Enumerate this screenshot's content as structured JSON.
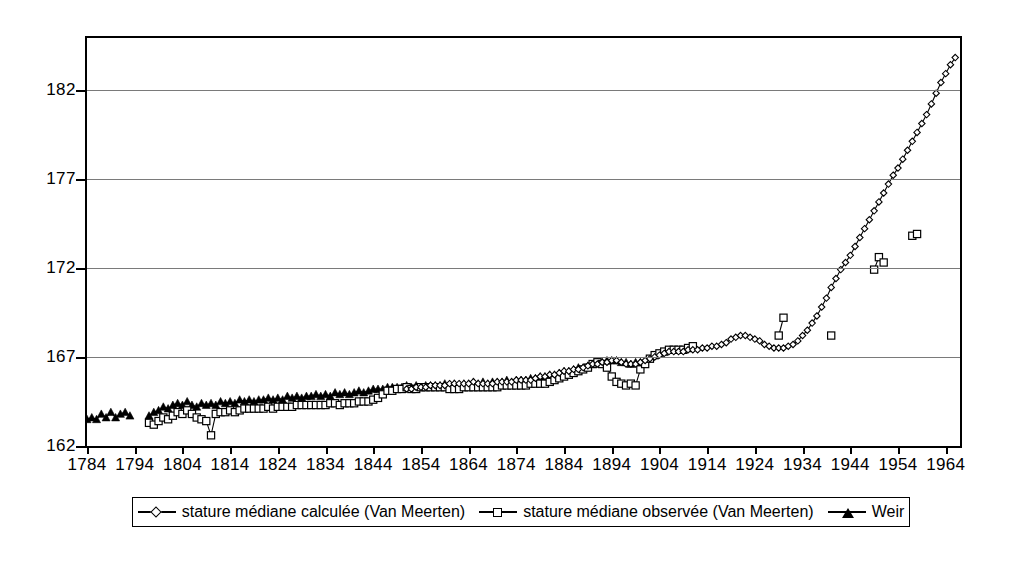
{
  "chart_data": {
    "type": "line",
    "title": "",
    "xlabel": "",
    "ylabel": "",
    "xlim": [
      1784,
      1967
    ],
    "ylim": [
      162,
      184.9
    ],
    "grid": true,
    "y_ticks": [
      162,
      167,
      172,
      177,
      182
    ],
    "x_ticks": [
      1784,
      1794,
      1804,
      1814,
      1824,
      1834,
      1844,
      1854,
      1864,
      1874,
      1884,
      1894,
      1904,
      1914,
      1924,
      1934,
      1944,
      1954,
      1964
    ],
    "legend_position": "bottom",
    "series": [
      {
        "name": "stature médiane calculée (Van Meerten)",
        "marker": "diamond",
        "line": true,
        "color": "#000000",
        "x": [
          1851,
          1852,
          1853,
          1854,
          1855,
          1856,
          1857,
          1858,
          1859,
          1860,
          1861,
          1862,
          1863,
          1864,
          1865,
          1866,
          1867,
          1868,
          1869,
          1870,
          1871,
          1872,
          1873,
          1874,
          1875,
          1876,
          1877,
          1878,
          1879,
          1880,
          1881,
          1882,
          1883,
          1884,
          1885,
          1886,
          1887,
          1888,
          1889,
          1890,
          1891,
          1892,
          1893,
          1894,
          1895,
          1896,
          1897,
          1898,
          1899,
          1900,
          1901,
          1902,
          1903,
          1904,
          1905,
          1906,
          1907,
          1908,
          1909,
          1910,
          1911,
          1912,
          1913,
          1914,
          1915,
          1916,
          1917,
          1918,
          1919,
          1920,
          1921,
          1922,
          1923,
          1924,
          1925,
          1926,
          1927,
          1928,
          1929,
          1930,
          1931,
          1932,
          1933,
          1934,
          1935,
          1936,
          1937,
          1938,
          1939,
          1940,
          1941,
          1942,
          1943,
          1944,
          1945,
          1946,
          1947,
          1948,
          1949,
          1950,
          1951,
          1952,
          1953,
          1954,
          1955,
          1956,
          1957,
          1958,
          1959,
          1960,
          1961,
          1962,
          1963,
          1964,
          1965,
          1966
        ],
        "y": [
          165.2,
          165.2,
          165.3,
          165.3,
          165.3,
          165.4,
          165.4,
          165.4,
          165.4,
          165.5,
          165.5,
          165.5,
          165.5,
          165.5,
          165.6,
          165.5,
          165.5,
          165.5,
          165.5,
          165.6,
          165.6,
          165.6,
          165.6,
          165.7,
          165.7,
          165.7,
          165.7,
          165.8,
          165.9,
          165.9,
          166.0,
          166.0,
          166.1,
          166.2,
          166.2,
          166.3,
          166.3,
          166.4,
          166.5,
          166.6,
          166.6,
          166.7,
          166.7,
          166.8,
          166.8,
          166.7,
          166.6,
          166.6,
          166.6,
          166.7,
          166.8,
          166.9,
          167.0,
          167.1,
          167.2,
          167.3,
          167.3,
          167.3,
          167.3,
          167.4,
          167.4,
          167.4,
          167.5,
          167.5,
          167.6,
          167.6,
          167.7,
          167.8,
          168.0,
          168.1,
          168.2,
          168.2,
          168.1,
          168.0,
          167.9,
          167.7,
          167.6,
          167.5,
          167.5,
          167.5,
          167.6,
          167.7,
          167.9,
          168.2,
          168.5,
          168.9,
          169.3,
          169.8,
          170.3,
          170.9,
          171.4,
          171.9,
          172.3,
          172.7,
          173.2,
          173.7,
          174.2,
          174.7,
          175.2,
          175.7,
          176.2,
          176.7,
          177.2,
          177.6,
          178.1,
          178.6,
          179.1,
          179.6,
          180.1,
          180.6,
          181.2,
          181.8,
          182.4,
          182.9,
          183.4,
          183.8
        ]
      },
      {
        "name": "stature médiane observée (Van Meerten)",
        "marker": "square",
        "line": true,
        "color": "#000000",
        "x": [
          1797,
          1798,
          1799,
          1800,
          1801,
          1802,
          1803,
          1804,
          1805,
          1806,
          1807,
          1808,
          1809,
          1810,
          1811,
          1812,
          1813,
          1814,
          1815,
          1816,
          1817,
          1818,
          1819,
          1820,
          1821,
          1822,
          1823,
          1824,
          1825,
          1826,
          1827,
          1828,
          1829,
          1830,
          1831,
          1832,
          1833,
          1834,
          1835,
          1836,
          1837,
          1838,
          1839,
          1840,
          1841,
          1842,
          1843,
          1844,
          1845,
          1846,
          1847,
          1848,
          1849,
          1850,
          1851,
          1852,
          1853,
          1854,
          1855,
          1856,
          1857,
          1858,
          1859,
          1860,
          1861,
          1862,
          1863,
          1864,
          1865,
          1866,
          1867,
          1868,
          1869,
          1870,
          1871,
          1872,
          1873,
          1874,
          1875,
          1876,
          1877,
          1878,
          1879,
          1880,
          1881,
          1882,
          1883,
          1884,
          1885,
          1886,
          1887,
          1888,
          1889,
          1890,
          1891,
          1892,
          1893,
          1894,
          1895,
          1896,
          1897,
          1898,
          1899,
          1900,
          1901,
          1902,
          1903,
          1904,
          1905,
          1906,
          1907,
          1908,
          1909,
          1910,
          1911,
          1929,
          1930,
          1940,
          1949,
          1950,
          1951,
          1957,
          1958
        ],
        "y": [
          163.3,
          163.2,
          163.4,
          163.6,
          163.5,
          163.7,
          163.9,
          163.8,
          164.0,
          163.8,
          163.6,
          163.5,
          163.4,
          162.6,
          163.8,
          163.9,
          163.9,
          164.0,
          163.9,
          164.0,
          164.1,
          164.1,
          164.1,
          164.1,
          164.1,
          164.2,
          164.1,
          164.2,
          164.2,
          164.2,
          164.2,
          164.3,
          164.3,
          164.3,
          164.3,
          164.3,
          164.3,
          164.3,
          164.4,
          164.4,
          164.3,
          164.4,
          164.4,
          164.4,
          164.5,
          164.5,
          164.5,
          164.6,
          164.7,
          164.9,
          165.1,
          165.1,
          165.2,
          165.2,
          165.3,
          165.2,
          165.2,
          165.3,
          165.3,
          165.3,
          165.3,
          165.3,
          165.3,
          165.2,
          165.2,
          165.2,
          165.3,
          165.3,
          165.3,
          165.3,
          165.3,
          165.3,
          165.3,
          165.3,
          165.4,
          165.4,
          165.4,
          165.4,
          165.4,
          165.4,
          165.5,
          165.5,
          165.5,
          165.5,
          165.6,
          165.7,
          165.8,
          165.9,
          166.0,
          166.1,
          166.2,
          166.3,
          166.4,
          166.6,
          166.7,
          166.6,
          166.4,
          165.9,
          165.6,
          165.5,
          165.4,
          165.5,
          165.4,
          166.3,
          166.6,
          166.9,
          167.1,
          167.2,
          167.3,
          167.4,
          167.4,
          167.4,
          167.4,
          167.5,
          167.6,
          168.2,
          169.2,
          168.2,
          171.9,
          172.6,
          172.3,
          173.8,
          173.9
        ]
      },
      {
        "name": "Weir",
        "marker": "triangle",
        "line": true,
        "color": "#000000",
        "x": [
          1784,
          1785,
          1786,
          1787,
          1788,
          1789,
          1790,
          1791,
          1792,
          1793,
          1797,
          1798,
          1799,
          1800,
          1801,
          1802,
          1803,
          1804,
          1805,
          1806,
          1807,
          1808,
          1809,
          1810,
          1811,
          1812,
          1813,
          1814,
          1815,
          1816,
          1817,
          1818,
          1819,
          1820,
          1821,
          1822,
          1823,
          1824,
          1825,
          1826,
          1827,
          1828,
          1829,
          1830,
          1831,
          1832,
          1833,
          1834,
          1835,
          1836,
          1837,
          1838,
          1839,
          1840,
          1841,
          1842,
          1843,
          1844,
          1845,
          1846,
          1847,
          1848,
          1849,
          1850,
          1851,
          1852,
          1853,
          1854,
          1855,
          1856,
          1857,
          1858,
          1859,
          1860,
          1861,
          1862,
          1863,
          1864,
          1865,
          1866,
          1867,
          1868,
          1869,
          1870,
          1871,
          1872,
          1873,
          1874,
          1875,
          1876,
          1877,
          1878,
          1879,
          1880,
          1881,
          1882,
          1883,
          1884,
          1885,
          1886,
          1887,
          1888,
          1889,
          1890,
          1891,
          1892,
          1893,
          1894,
          1895,
          1896,
          1897,
          1898,
          1899,
          1900
        ],
        "y": [
          163.5,
          163.6,
          163.5,
          163.8,
          163.6,
          163.9,
          163.6,
          163.8,
          163.9,
          163.7,
          163.7,
          163.9,
          164.0,
          164.2,
          164.1,
          164.3,
          164.4,
          164.3,
          164.5,
          164.3,
          164.2,
          164.4,
          164.3,
          164.4,
          164.3,
          164.5,
          164.4,
          164.5,
          164.4,
          164.6,
          164.5,
          164.6,
          164.5,
          164.6,
          164.6,
          164.7,
          164.6,
          164.7,
          164.6,
          164.8,
          164.7,
          164.8,
          164.7,
          164.8,
          164.8,
          164.9,
          164.8,
          164.9,
          164.8,
          165.0,
          164.9,
          165.0,
          164.9,
          165.0,
          165.1,
          165.0,
          165.1,
          165.2,
          165.2,
          165.2,
          165.3,
          165.3,
          165.3,
          165.3,
          165.4,
          165.3,
          165.4,
          165.3,
          165.4,
          165.4,
          165.4,
          165.4,
          165.5,
          165.4,
          165.5,
          165.4,
          165.5,
          165.5,
          165.6,
          165.5,
          165.6,
          165.5,
          165.6,
          165.6,
          165.6,
          165.7,
          165.6,
          165.7,
          165.7,
          165.7,
          165.8,
          165.8,
          165.9,
          165.9,
          166.0,
          166.0,
          166.1,
          166.2,
          166.2,
          166.3,
          166.4,
          166.4,
          166.5,
          166.6,
          166.7,
          166.7,
          166.8,
          166.8,
          166.8,
          166.7,
          166.7,
          166.6,
          166.7,
          166.7
        ]
      }
    ]
  },
  "legend": {
    "entries": [
      {
        "label": "stature médiane calculée (Van Meerten)",
        "marker": "diamond"
      },
      {
        "label": "stature médiane observée (Van Meerten)",
        "marker": "square"
      },
      {
        "label": "Weir",
        "marker": "triangle"
      }
    ]
  }
}
